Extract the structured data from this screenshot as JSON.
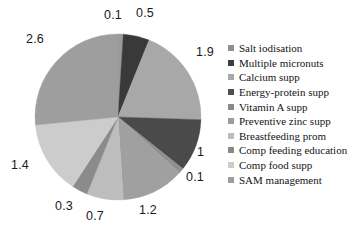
{
  "chart_data": {
    "type": "pie",
    "title": "",
    "total": 9.8,
    "legend_position": "right",
    "categories": [
      "Salt iodisation",
      "Multiple micronuts",
      "Calcium supp",
      "Energy-protein supp",
      "Vitamin A supp",
      "Preventive zinc supp",
      "Breastfeeding prom",
      "Comp feeding education",
      "Comp food supp",
      "SAM management"
    ],
    "values": [
      0.1,
      0.5,
      1.9,
      1,
      0.1,
      1.2,
      0.7,
      0.3,
      1.4,
      2.6
    ],
    "value_labels": [
      "0.1",
      "0.5",
      "1.9",
      "1",
      "0.1",
      "1.2",
      "0.7",
      "0.3",
      "1.4",
      "2.6"
    ],
    "colors": [
      "#9a9a9a",
      "#393939",
      "#a8a8a8",
      "#4a4a4a",
      "#8f8f8f",
      "#a0a0a0",
      "#bdbdbd",
      "#8b8b8b",
      "#cccccc",
      "#9e9e9e"
    ],
    "start_angle_deg": -90,
    "direction": "clockwise"
  },
  "legend": {
    "items": [
      {
        "label": "Salt iodisation",
        "color": "#8f8f8f"
      },
      {
        "label": "Multiple micronuts",
        "color": "#3d3d3d"
      },
      {
        "label": "Calcium supp",
        "color": "#a8a8a8"
      },
      {
        "label": "Energy-protein supp",
        "color": "#4f4f4f"
      },
      {
        "label": "Vitamin A supp",
        "color": "#8a8a8a"
      },
      {
        "label": "Preventive zinc supp",
        "color": "#9c9c9c"
      },
      {
        "label": "Breastfeeding prom",
        "color": "#bdbdbd"
      },
      {
        "label": "Comp feeding education",
        "color": "#888888"
      },
      {
        "label": "Comp food supp",
        "color": "#cccccc"
      },
      {
        "label": "SAM management",
        "color": "#9e9e9e"
      }
    ]
  },
  "labels": {
    "l0": "0.1",
    "l1": "0.5",
    "l2": "1.9",
    "l3": "1",
    "l4": "0.1",
    "l5": "1.2",
    "l6": "0.7",
    "l7": "0.3",
    "l8": "1.4",
    "l9": "2.6"
  }
}
